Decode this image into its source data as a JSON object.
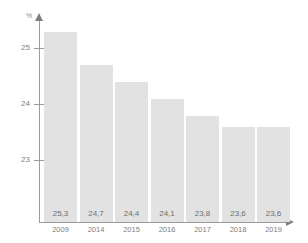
{
  "chart_data": {
    "type": "bar",
    "title": "",
    "xlabel": "",
    "ylabel": "%",
    "categories": [
      "2009",
      "2014",
      "2015",
      "2016",
      "2017",
      "2018",
      "2019"
    ],
    "values": [
      25.3,
      24.7,
      24.4,
      24.1,
      23.8,
      23.6,
      23.6
    ],
    "value_labels": [
      "25,3",
      "24,7",
      "24,4",
      "24,1",
      "23,8",
      "23,6",
      "23,6"
    ],
    "ytick_labels": [
      "25",
      "24",
      "23"
    ],
    "ytick_values": [
      25,
      24,
      23
    ],
    "ylim": [
      21.9,
      25.75
    ],
    "grid": false,
    "legend": null,
    "bar_color": "#e2e2e2",
    "axis_color": "#9a9a9a",
    "text_color": "#7d7d7d"
  },
  "axis": {
    "unit_label": "%"
  }
}
